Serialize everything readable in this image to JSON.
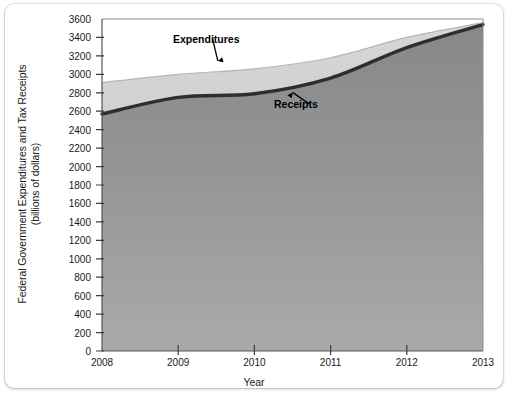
{
  "figure": {
    "background_color": "#ffffff",
    "plot_border_color": "#555555"
  },
  "chart_data": {
    "type": "area",
    "title": "",
    "subtitle": "",
    "xlabel": "Year",
    "ylabel": "Federal Government Expenditures and Tax Receipts",
    "ylabel_line2": "(billions of dollars)",
    "ylabel_units": "billions of dollars",
    "x": [
      2008,
      2009,
      2010,
      2011,
      2012,
      2013
    ],
    "categories": [
      "2008",
      "2009",
      "2010",
      "2011",
      "2012",
      "2013"
    ],
    "xlim": [
      2008,
      2013
    ],
    "ylim": [
      0,
      3600
    ],
    "xticks": [
      2008,
      2009,
      2010,
      2011,
      2012,
      2013
    ],
    "xtick_labels": [
      "2008",
      "2009",
      "2010",
      "2011",
      "2012",
      "2013"
    ],
    "yticks": [
      0,
      200,
      400,
      600,
      800,
      1000,
      1200,
      1400,
      1600,
      1800,
      2000,
      2200,
      2400,
      2600,
      2800,
      3000,
      3200,
      3400,
      3600
    ],
    "ytick_labels": [
      "0",
      "200",
      "400",
      "600",
      "800",
      "1000",
      "1200",
      "1400",
      "1600",
      "1800",
      "2000",
      "2200",
      "2400",
      "2600",
      "2800",
      "3000",
      "3200",
      "3400",
      "3600"
    ],
    "grid": false,
    "legend_position": "none",
    "series": [
      {
        "name": "Expenditures",
        "color": "#c9cbcd",
        "line_color": "#b4b6b8",
        "values": [
          2910,
          3000,
          3060,
          3180,
          3400,
          3560
        ]
      },
      {
        "name": "Receipts",
        "color": "#8f9193",
        "line_color": "#2e2e2e",
        "values": [
          2570,
          2750,
          2790,
          2960,
          3290,
          3540
        ]
      }
    ],
    "annotations": [
      {
        "label": "Expenditures",
        "series": "Expenditures",
        "arrow_direction": "down",
        "text_x": 2009.45,
        "text_y": 3390,
        "point_x": 2009.52,
        "point_y": 3070
      },
      {
        "label": "Receipts",
        "series": "Receipts",
        "arrow_direction": "up",
        "text_x": 2010.72,
        "text_y": 2680,
        "point_x": 2010.5,
        "point_y": 2880
      }
    ]
  }
}
